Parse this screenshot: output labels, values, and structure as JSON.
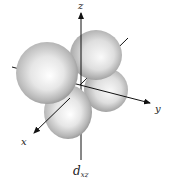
{
  "diagram": {
    "axes": {
      "z": "z",
      "y": "y",
      "x": "x"
    },
    "orbital_label": {
      "main": "d",
      "subscript": "xz"
    },
    "colors": {
      "lobe_light": "#ffffff",
      "lobe_mid": "#d4d4d4",
      "lobe_dark": "#8c8c8c",
      "axis": "#111111",
      "background": "#ffffff"
    }
  }
}
